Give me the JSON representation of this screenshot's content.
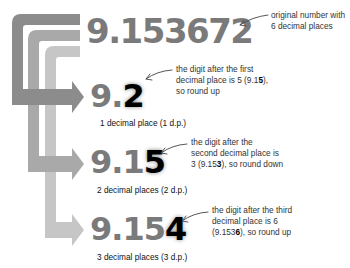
{
  "original": {
    "number": "9.153672",
    "note": [
      "original number with",
      "6 decimal places"
    ]
  },
  "steps": [
    {
      "prefix": "9.",
      "rounded_digit": "2",
      "caption": "1 decimal place (1 d.p.)",
      "note_line1": "the digit after the first",
      "note_line2_pre": "decimal place is 5 (9.1",
      "note_line2_bold": "5",
      "note_line2_post": "),",
      "note_line3_pre": "so round up",
      "note_line3_bold": "",
      "note_line3_post": ""
    },
    {
      "prefix": "9.1",
      "rounded_digit": "5",
      "caption": "2 decimal places (2 d.p.)",
      "note_line1": "the digit after the",
      "note_line2_pre": "second decimal place is",
      "note_line2_bold": "",
      "note_line2_post": "",
      "note_line3_pre": "3 (9.15",
      "note_line3_bold": "3",
      "note_line3_post": "), so round down"
    },
    {
      "prefix": "9.15",
      "rounded_digit": "4",
      "caption": "3 decimal places (3 d.p.)",
      "note_line1": "the digit after the third",
      "note_line2_pre": "decimal place is 6",
      "note_line2_bold": "",
      "note_line2_post": "",
      "note_line3_pre": "(9.153",
      "note_line3_bold": "6",
      "note_line3_post": "), so round up"
    }
  ],
  "colors": {
    "arrow_dark": "#8c8c8c",
    "arrow_mid": "#a9a9a9",
    "arrow_light": "#c6c6c6",
    "number_gray": "#7a7a7a",
    "highlight": "#000000"
  }
}
